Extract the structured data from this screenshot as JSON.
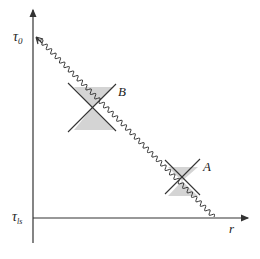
{
  "diagram": {
    "y_axis_top_label": "τ",
    "y_axis_top_sub": "0",
    "y_axis_bottom_label": "τ",
    "y_axis_bottom_sub": "ls",
    "x_axis_label": "r",
    "cones": [
      {
        "label": "B"
      },
      {
        "label": "A"
      }
    ],
    "colors": {
      "ink": "#333333",
      "cone_fill": "#d4d4d4"
    }
  }
}
